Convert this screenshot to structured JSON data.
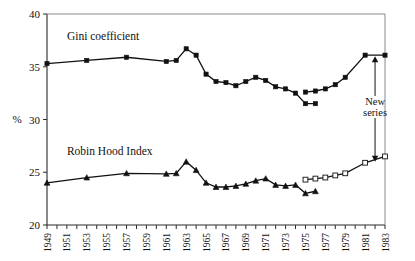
{
  "chart_data": {
    "type": "line",
    "title": "",
    "xlabel": "",
    "ylabel": "%",
    "ylim": [
      20,
      40
    ],
    "xlim": [
      1949,
      1983
    ],
    "yticks": [
      20,
      25,
      30,
      35,
      40
    ],
    "ytick_labels": [
      "20",
      "25",
      "30",
      "35",
      "40"
    ],
    "x": [
      1949,
      1950,
      1951,
      1952,
      1953,
      1954,
      1955,
      1956,
      1957,
      1958,
      1959,
      1960,
      1961,
      1962,
      1963,
      1964,
      1965,
      1966,
      1967,
      1968,
      1969,
      1970,
      1971,
      1972,
      1973,
      1974,
      1975,
      1976,
      1977,
      1978,
      1979,
      1980,
      1981,
      1982,
      1983
    ],
    "xtick_labels": [
      "1949",
      "1951",
      "1953",
      "1955",
      "1957",
      "1959",
      "1961",
      "1963",
      "1965",
      "1967",
      "1969",
      "1971",
      "1973",
      "1975",
      "1977",
      "1979",
      "1981",
      "1983"
    ],
    "xtick_years": [
      1949,
      1951,
      1953,
      1955,
      1957,
      1959,
      1961,
      1963,
      1965,
      1967,
      1969,
      1971,
      1973,
      1975,
      1977,
      1979,
      1981,
      1983
    ],
    "grid": false,
    "legend_position": "inline-labels",
    "series": [
      {
        "name": "Gini coefficient",
        "marker": "filled-square",
        "label_x": 1951.0,
        "label_y": 37.5,
        "points": [
          {
            "x": 1949,
            "y": 35.3
          },
          {
            "x": 1953,
            "y": 35.6
          },
          {
            "x": 1957,
            "y": 35.9
          },
          {
            "x": 1961,
            "y": 35.5
          },
          {
            "x": 1962,
            "y": 35.6
          },
          {
            "x": 1963,
            "y": 36.7
          },
          {
            "x": 1964,
            "y": 36.1
          },
          {
            "x": 1965,
            "y": 34.3
          },
          {
            "x": 1966,
            "y": 33.6
          },
          {
            "x": 1967,
            "y": 33.5
          },
          {
            "x": 1968,
            "y": 33.2
          },
          {
            "x": 1969,
            "y": 33.6
          },
          {
            "x": 1970,
            "y": 34.0
          },
          {
            "x": 1971,
            "y": 33.7
          },
          {
            "x": 1972,
            "y": 33.1
          },
          {
            "x": 1973,
            "y": 32.9
          },
          {
            "x": 1974,
            "y": 32.5
          },
          {
            "x": 1975,
            "y": 31.5
          },
          {
            "x": 1976,
            "y": 31.5
          }
        ]
      },
      {
        "name": "Gini coefficient (new series)",
        "marker": "filled-square",
        "points": [
          {
            "x": 1975,
            "y": 32.6
          },
          {
            "x": 1976,
            "y": 32.7
          },
          {
            "x": 1977,
            "y": 32.9
          },
          {
            "x": 1978,
            "y": 33.3
          },
          {
            "x": 1979,
            "y": 34.0
          },
          {
            "x": 1981,
            "y": 36.1
          },
          {
            "x": 1983,
            "y": 36.1
          }
        ]
      },
      {
        "name": "Robin Hood Index",
        "marker": "filled-triangle",
        "label_x": 1951.0,
        "label_y": 26.6,
        "points": [
          {
            "x": 1949,
            "y": 24.0
          },
          {
            "x": 1953,
            "y": 24.5
          },
          {
            "x": 1957,
            "y": 24.9
          },
          {
            "x": 1961,
            "y": 24.85
          },
          {
            "x": 1962,
            "y": 24.9
          },
          {
            "x": 1963,
            "y": 26.0
          },
          {
            "x": 1964,
            "y": 25.2
          },
          {
            "x": 1965,
            "y": 24.0
          },
          {
            "x": 1966,
            "y": 23.6
          },
          {
            "x": 1967,
            "y": 23.6
          },
          {
            "x": 1968,
            "y": 23.7
          },
          {
            "x": 1969,
            "y": 23.9
          },
          {
            "x": 1970,
            "y": 24.2
          },
          {
            "x": 1971,
            "y": 24.4
          },
          {
            "x": 1972,
            "y": 23.8
          },
          {
            "x": 1973,
            "y": 23.7
          },
          {
            "x": 1974,
            "y": 23.8
          },
          {
            "x": 1975,
            "y": 23.0
          },
          {
            "x": 1976,
            "y": 23.2
          }
        ]
      },
      {
        "name": "Robin Hood Index (new series)",
        "marker": "open-square",
        "points": [
          {
            "x": 1975,
            "y": 24.3
          },
          {
            "x": 1976,
            "y": 24.4
          },
          {
            "x": 1977,
            "y": 24.5
          },
          {
            "x": 1978,
            "y": 24.7
          },
          {
            "x": 1979,
            "y": 24.9
          },
          {
            "x": 1981,
            "y": 25.9
          },
          {
            "x": 1983,
            "y": 26.5
          }
        ]
      }
    ],
    "annotations": [
      {
        "name": "new-series-annotation",
        "text_line1": "New",
        "text_line2": "series",
        "x": 1982.0,
        "arrow_top_y": 36.1,
        "arrow_bottom_y": 25.9
      }
    ]
  }
}
